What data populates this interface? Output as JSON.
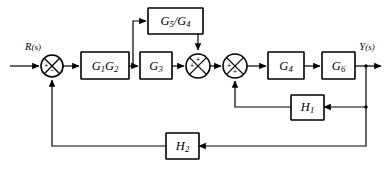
{
  "diagram": {
    "input_label": {
      "signal": "R",
      "arg": "(s)"
    },
    "output_label": {
      "signal": "Y",
      "arg": "(s)"
    },
    "colors": {
      "stroke": "#000000",
      "background": "#ffffff",
      "fill": "#ffffff"
    },
    "blocks": [
      {
        "id": "g5g4",
        "label_main": "G",
        "label_sub": "5",
        "label_tail": "/G",
        "label_tail_sub": "4",
        "x": 148,
        "y": 8,
        "w": 55,
        "h": 26
      },
      {
        "id": "g1g2",
        "label_main": "G",
        "label_sub": "1",
        "label_tail": "G",
        "label_tail_sub": "2",
        "x": 81,
        "y": 52,
        "w": 48,
        "h": 27
      },
      {
        "id": "g3",
        "label_main": "G",
        "label_sub": "3",
        "label_tail": "",
        "label_tail_sub": "",
        "x": 140,
        "y": 52,
        "w": 32,
        "h": 27
      },
      {
        "id": "g4",
        "label_main": "G",
        "label_sub": "4",
        "label_tail": "",
        "label_tail_sub": "",
        "x": 268,
        "y": 52,
        "w": 36,
        "h": 27
      },
      {
        "id": "g6",
        "label_main": "G",
        "label_sub": "6",
        "label_tail": "",
        "label_tail_sub": "",
        "x": 322,
        "y": 52,
        "w": 33,
        "h": 27
      },
      {
        "id": "h1",
        "label_main": "H",
        "label_sub": "1",
        "label_tail": "",
        "label_tail_sub": "",
        "x": 291,
        "y": 95,
        "w": 30,
        "h": 25
      },
      {
        "id": "h2",
        "label_main": "H",
        "label_sub": "2",
        "label_tail": "",
        "label_tail_sub": "",
        "x": 166,
        "y": 133,
        "w": 30,
        "h": 26
      }
    ],
    "summers": [
      {
        "id": "sum1",
        "cx": 52,
        "cy": 66,
        "r": 11,
        "signs": [
          {
            "pos": "west",
            "text": "+"
          },
          {
            "pos": "south",
            "text": "−"
          }
        ]
      },
      {
        "id": "sum2",
        "cx": 198,
        "cy": 66,
        "r": 12,
        "signs": [
          {
            "pos": "west",
            "text": "+"
          },
          {
            "pos": "north",
            "text": "+"
          }
        ]
      },
      {
        "id": "sum3",
        "cx": 235,
        "cy": 66,
        "r": 12,
        "signs": [
          {
            "pos": "west",
            "text": "+"
          },
          {
            "pos": "south",
            "text": "+"
          }
        ]
      }
    ],
    "junction_dots": [
      {
        "id": "tap-g1g2-out",
        "cx": 133,
        "cy": 66
      },
      {
        "id": "tap-output-h1",
        "cx": 366,
        "cy": 66
      },
      {
        "id": "tap-output-h2",
        "cx": 366,
        "cy": 66
      }
    ],
    "signal_paths": [
      {
        "id": "input-to-sum1",
        "from": "R(s)",
        "to": "sum1"
      },
      {
        "id": "sum1-to-g1g2",
        "from": "sum1",
        "to": "g1g2"
      },
      {
        "id": "g1g2-to-g3",
        "from": "g1g2",
        "to": "g3"
      },
      {
        "id": "g1g2-to-g5g4",
        "from": "g1g2",
        "to": "g5g4"
      },
      {
        "id": "g5g4-to-sum2",
        "from": "g5g4",
        "to": "sum2"
      },
      {
        "id": "g3-to-sum2",
        "from": "g3",
        "to": "sum2"
      },
      {
        "id": "sum2-to-sum3",
        "from": "sum2",
        "to": "sum3"
      },
      {
        "id": "sum3-to-g4",
        "from": "sum3",
        "to": "g4"
      },
      {
        "id": "g4-to-g6",
        "from": "g4",
        "to": "g6"
      },
      {
        "id": "g6-to-output",
        "from": "g6",
        "to": "Y(s)"
      },
      {
        "id": "output-to-h1",
        "from": "output",
        "to": "h1"
      },
      {
        "id": "h1-to-sum3",
        "from": "h1",
        "to": "sum3"
      },
      {
        "id": "output-to-h2",
        "from": "output",
        "to": "h2"
      },
      {
        "id": "h2-to-sum1",
        "from": "h2",
        "to": "sum1"
      }
    ]
  }
}
